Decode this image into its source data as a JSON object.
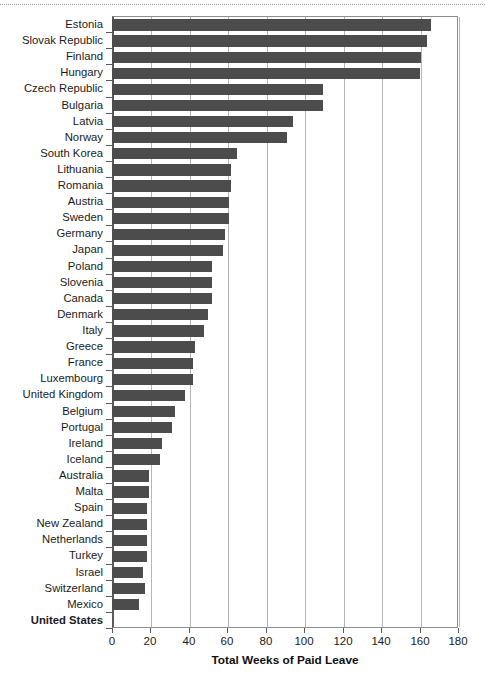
{
  "chart_data": {
    "type": "bar",
    "orientation": "horizontal",
    "title": "",
    "xlabel": "Total Weeks of Paid Leave",
    "ylabel": "",
    "xlim": [
      0,
      180
    ],
    "xticks": [
      0,
      20,
      40,
      60,
      80,
      100,
      120,
      140,
      160,
      180
    ],
    "grid": "vertical",
    "legend": "none",
    "bar_color": "#4c4c4c",
    "emphasized_categories": [
      "United States"
    ],
    "categories": [
      "Estonia",
      "Slovak Republic",
      "Finland",
      "Hungary",
      "Czech Republic",
      "Bulgaria",
      "Latvia",
      "Norway",
      "South Korea",
      "Lithuania",
      "Romania",
      "Austria",
      "Sweden",
      "Germany",
      "Japan",
      "Poland",
      "Slovenia",
      "Canada",
      "Denmark",
      "Italy",
      "Greece",
      "France",
      "Luxembourg",
      "United Kingdom",
      "Belgium",
      "Portugal",
      "Ireland",
      "Iceland",
      "Australia",
      "Malta",
      "Spain",
      "New Zealand",
      "Netherlands",
      "Turkey",
      "Israel",
      "Switzerland",
      "Mexico",
      "United States"
    ],
    "values": [
      166,
      164,
      161,
      160,
      110,
      110,
      94,
      91,
      65,
      62,
      62,
      61,
      61,
      59,
      58,
      52,
      52,
      52,
      50,
      48,
      43,
      42,
      42,
      38,
      33,
      31,
      26,
      25,
      19,
      19,
      18,
      18,
      18,
      18,
      16,
      17,
      14,
      0
    ]
  }
}
